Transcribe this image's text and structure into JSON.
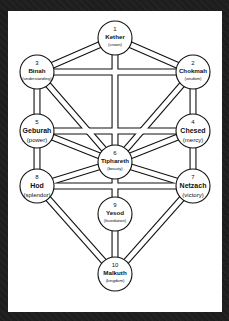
{
  "diagram": {
    "colors": {
      "background": "#1c1c1c",
      "panel": "#ffffff",
      "stroke": "#111111",
      "node_fill": "#ffffff"
    },
    "nodes": [
      {
        "id": "kether",
        "number": "1",
        "name": "Kether",
        "meaning": "(crown)",
        "cx": 115,
        "cy": 38,
        "size": "small"
      },
      {
        "id": "chokmah",
        "number": "2",
        "name": "Chokmah",
        "meaning": "(wisdom)",
        "cx": 193,
        "cy": 72,
        "size": "small"
      },
      {
        "id": "binah",
        "number": "3",
        "name": "Binah",
        "meaning": "(understanding)",
        "cx": 37,
        "cy": 72,
        "size": "small"
      },
      {
        "id": "chesed",
        "number": "4",
        "name": "Chesed",
        "meaning": "(mercy)",
        "cx": 193,
        "cy": 131,
        "size": "big"
      },
      {
        "id": "geburah",
        "number": "5",
        "name": "Geburah",
        "meaning": "(power)",
        "cx": 37,
        "cy": 131,
        "size": "big"
      },
      {
        "id": "tiphareth",
        "number": "6",
        "name": "Tiphareth",
        "meaning": "(beauty)",
        "cx": 115,
        "cy": 162,
        "size": "small"
      },
      {
        "id": "netzach",
        "number": "7",
        "name": "Netzach",
        "meaning": "(victory)",
        "cx": 193,
        "cy": 186,
        "size": "big"
      },
      {
        "id": "hod",
        "number": "8",
        "name": "Hod",
        "meaning": "(splendor)",
        "cx": 37,
        "cy": 186,
        "size": "big"
      },
      {
        "id": "yesod",
        "number": "9",
        "name": "Yesod",
        "meaning": "(foundation)",
        "cx": 115,
        "cy": 214,
        "size": "small"
      },
      {
        "id": "malkuth",
        "number": "10",
        "name": "Malkuth",
        "meaning": "(kingdom)",
        "cx": 115,
        "cy": 274,
        "size": "small"
      }
    ],
    "paths": [
      [
        "kether",
        "chokmah"
      ],
      [
        "kether",
        "binah"
      ],
      [
        "kether",
        "tiphareth"
      ],
      [
        "chokmah",
        "binah"
      ],
      [
        "chokmah",
        "chesed"
      ],
      [
        "chokmah",
        "tiphareth"
      ],
      [
        "binah",
        "geburah"
      ],
      [
        "binah",
        "tiphareth"
      ],
      [
        "chesed",
        "geburah"
      ],
      [
        "chesed",
        "tiphareth"
      ],
      [
        "chesed",
        "netzach"
      ],
      [
        "geburah",
        "tiphareth"
      ],
      [
        "geburah",
        "hod"
      ],
      [
        "tiphareth",
        "netzach"
      ],
      [
        "tiphareth",
        "hod"
      ],
      [
        "tiphareth",
        "yesod"
      ],
      [
        "netzach",
        "hod"
      ],
      [
        "netzach",
        "malkuth"
      ],
      [
        "hod",
        "malkuth"
      ],
      [
        "yesod",
        "malkuth"
      ]
    ],
    "node_radius": 17,
    "path_width": 7
  }
}
